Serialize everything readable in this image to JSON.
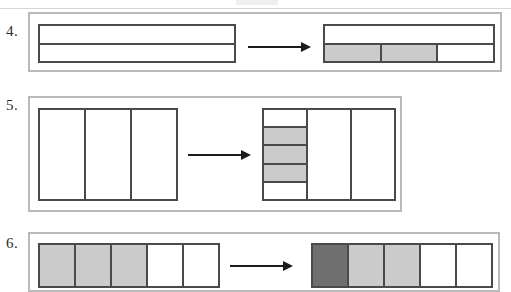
{
  "worksheet": {
    "type": "fraction-area-model-worksheet",
    "background_color": "#ffffff",
    "ink_color": "#4a4a4a",
    "frame_color": "#b9b9b9",
    "shade_light": "#cbcbcb",
    "shade_dark": "#6f6f6f",
    "arrow_color": "#1c1c1c"
  },
  "problems": [
    {
      "number": "4.",
      "left_shape": {
        "name": "rectangle-split-into-2-horizontal-rows",
        "orientation": "rows",
        "cells": 2,
        "shaded": []
      },
      "arrow": "right-arrow",
      "right_shape": {
        "name": "rectangle-2-rows-bottom-row-split-in-3-with-2-shaded",
        "orientation": "rows",
        "cells": 2,
        "subdivided_cell_index": 1,
        "subdivision_cells": 3,
        "subdivision_shaded": [
          0,
          1
        ]
      }
    },
    {
      "number": "5.",
      "left_shape": {
        "name": "rectangle-split-into-3-vertical-columns",
        "orientation": "cols",
        "cells": 3,
        "shaded": []
      },
      "arrow": "right-arrow",
      "right_shape": {
        "name": "rectangle-3-columns-first-column-split-in-5-with-3-shaded",
        "orientation": "cols",
        "cells": 3,
        "subdivided_cell_index": 0,
        "subdivision_cells": 5,
        "subdivision_shaded": [
          1,
          2,
          3
        ]
      }
    },
    {
      "number": "6.",
      "left_shape": {
        "name": "rectangle-split-into-5-columns-3-shaded",
        "orientation": "cols",
        "cells": 5,
        "shaded": [
          0,
          1,
          2
        ]
      },
      "arrow": "right-arrow",
      "right_shape": {
        "name": "rectangle-split-into-5-columns-1-dark-2-light",
        "orientation": "cols",
        "cells": 5,
        "shaded_dark": [
          0
        ],
        "shaded": [
          1,
          2
        ]
      }
    }
  ]
}
